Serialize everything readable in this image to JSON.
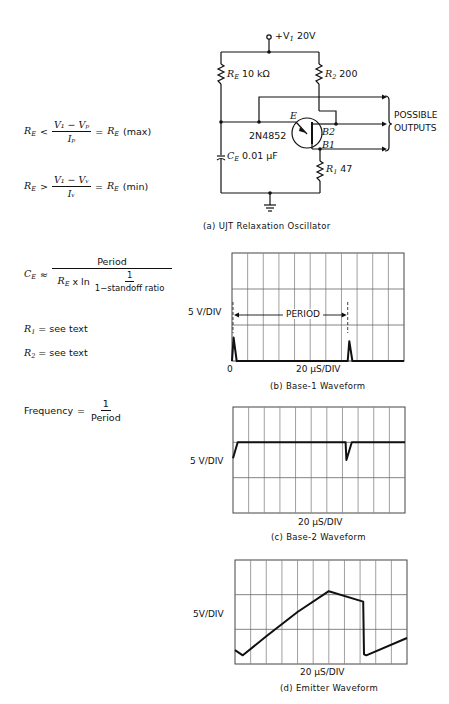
{
  "circuit": {
    "title": "(a) UJT Relaxation Oscillator",
    "supply_label": "+V",
    "supply_sub": "1",
    "supply_value": "20V",
    "re_label": "R",
    "re_sub": "E",
    "re_value": "10 kΩ",
    "r2_label": "R",
    "r2_sub": "2",
    "r2_value": "200",
    "r1_label": "R",
    "r1_sub": "1",
    "r1_value": "47",
    "ce_label": "C",
    "ce_sub": "E",
    "ce_value": "0.01 μF",
    "transistor": "2N4852",
    "pin_e": "E",
    "pin_b2": "B2",
    "pin_b1": "B1",
    "outputs_line1": "POSSIBLE",
    "outputs_line2": "OUTPUTS"
  },
  "equations": {
    "re_max": {
      "lhs": "R",
      "lhs_sub": "E",
      "op": "<",
      "num": "V₁ − Vₚ",
      "den": "Iₚ",
      "eq": "=",
      "rhs": "R",
      "rhs_sub": "E",
      "suffix": "(max)"
    },
    "re_min": {
      "lhs": "R",
      "lhs_sub": "E",
      "op": ">",
      "num": "V₁ − Vᵥ",
      "den": "Iᵥ",
      "eq": "=",
      "rhs": "R",
      "rhs_sub": "E",
      "suffix": "(min)"
    },
    "ce": {
      "lhs": "C",
      "lhs_sub": "E",
      "op": "≈",
      "num": "Period",
      "den_prefix": "R",
      "den_prefix_sub": "E",
      "den_mid": "x ln",
      "inner_num": "1",
      "inner_den": "1−standoff ratio"
    },
    "r1": {
      "lhs": "R",
      "lhs_sub": "1",
      "text": "= see text"
    },
    "r2": {
      "lhs": "R",
      "lhs_sub": "2",
      "text": "= see text"
    },
    "freq": {
      "lhs": "Frequency",
      "eq": "=",
      "num": "1",
      "den": "Period"
    }
  },
  "chart_data": [
    {
      "type": "line",
      "title": "(b) Base-1 Waveform",
      "ylabel": "5 V/DIV",
      "xlabel": "20 μS/DIV",
      "origin_label": "0",
      "annotation": "PERIOD",
      "grid": {
        "cols": 11,
        "rows": 3
      },
      "x_div": [
        0,
        0.1,
        0.3,
        7.4,
        7.5,
        7.7,
        11
      ],
      "y_div": [
        0,
        0.65,
        0,
        0,
        0.55,
        0,
        0
      ]
    },
    {
      "type": "line",
      "title": "(c) Base-2 Waveform",
      "ylabel": "5 V/DIV",
      "xlabel": "20 μS/DIV",
      "grid": {
        "cols": 11,
        "rows": 3
      },
      "x_div": [
        0,
        0.3,
        7.2,
        7.25,
        7.6,
        11
      ],
      "y_div": [
        1.55,
        2.0,
        2.0,
        1.5,
        2.0,
        2.0
      ]
    },
    {
      "type": "line",
      "title": "(d) Emitter Waveform",
      "ylabel": "5V/DIV",
      "xlabel": "20 μS/DIV",
      "grid": {
        "cols": 11,
        "rows": 3
      },
      "x_div": [
        0,
        0.5,
        2.0,
        4.0,
        6.0,
        8.2,
        8.25,
        8.4,
        11
      ],
      "y_div": [
        0.4,
        0.25,
        0.8,
        1.5,
        2.1,
        1.8,
        0.28,
        0.25,
        0.75
      ]
    }
  ]
}
